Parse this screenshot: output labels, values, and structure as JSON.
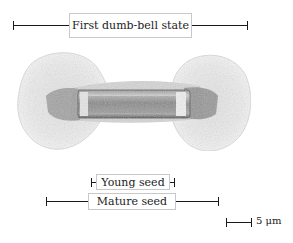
{
  "figure": {
    "type": "micrograph",
    "annotations": {
      "first_state": "First dumb-bell state",
      "young_seed": "Young seed",
      "mature_seed": "Mature seed"
    },
    "scale_bar": {
      "label": "5 μm",
      "value": 5,
      "unit": "μm"
    }
  }
}
